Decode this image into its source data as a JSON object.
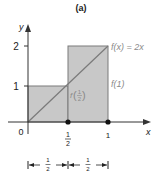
{
  "diagram": {
    "panel_label": "(a)",
    "axes": {
      "x_label": "x",
      "y_label": "y",
      "origin_label": "0",
      "y_ticks": [
        "1",
        "2"
      ],
      "x_ticks": [
        {
          "num": "1",
          "den": "2"
        },
        {
          "num": "1",
          "den": ""
        }
      ]
    },
    "function_label": "f(x) = 2x",
    "right_rect_label": "f(1)",
    "left_rect_label": {
      "prefix": "f",
      "num": "1",
      "den": "2"
    },
    "interval_widths": [
      {
        "num": "1",
        "den": "2"
      },
      {
        "num": "1",
        "den": "2"
      }
    ],
    "colors": {
      "fill": "#c8c8c8",
      "edge": "#7a7a7a",
      "axis": "#333333",
      "label_gray": "#8a8a8a",
      "text": "#222222"
    }
  }
}
